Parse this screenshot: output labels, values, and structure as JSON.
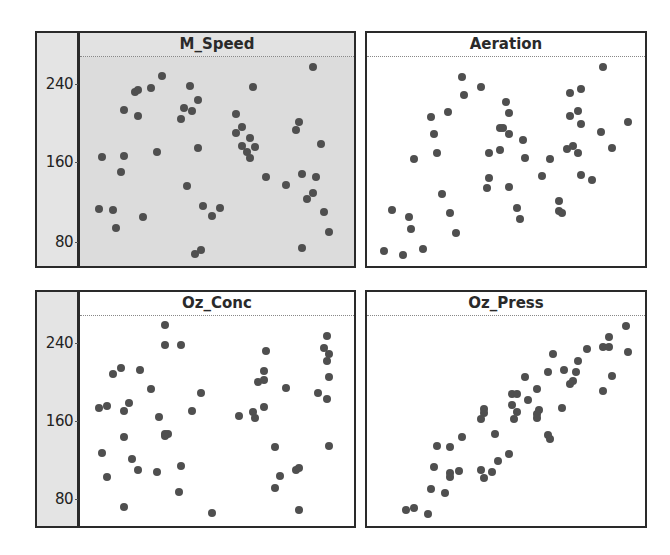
{
  "chart_data": {
    "type": "scatter",
    "title": "",
    "layout": "2x2 scatter plot matrix, shared y-axis on left",
    "y_ticks": [
      80,
      160,
      240
    ],
    "ylim": [
      51,
      274
    ],
    "x_ticks": [],
    "x_note": "x values are normalized positions (0-1) across each panel; no x-axis labels are shown",
    "grid": false,
    "legend": null,
    "panels": [
      {
        "name": "M_Speed",
        "selected": true,
        "points": [
          [
            0.3,
            246
          ],
          [
            0.26,
            234
          ],
          [
            0.2,
            230
          ],
          [
            0.21,
            232
          ],
          [
            0.4,
            236
          ],
          [
            0.43,
            222
          ],
          [
            0.38,
            213
          ],
          [
            0.41,
            210
          ],
          [
            0.16,
            211
          ],
          [
            0.21,
            205
          ],
          [
            0.37,
            202
          ],
          [
            0.08,
            163
          ],
          [
            0.16,
            164
          ],
          [
            0.28,
            168
          ],
          [
            0.43,
            172
          ],
          [
            0.15,
            148
          ],
          [
            0.39,
            133
          ],
          [
            0.07,
            110
          ],
          [
            0.12,
            109
          ],
          [
            0.23,
            102
          ],
          [
            0.13,
            90
          ],
          [
            0.45,
            113
          ],
          [
            0.48,
            103
          ],
          [
            0.42,
            64
          ],
          [
            0.44,
            68
          ],
          [
            0.85,
            255
          ],
          [
            0.63,
            235
          ],
          [
            0.57,
            207
          ],
          [
            0.59,
            194
          ],
          [
            0.57,
            188
          ],
          [
            0.8,
            199
          ],
          [
            0.79,
            191
          ],
          [
            0.62,
            183
          ],
          [
            0.59,
            174
          ],
          [
            0.64,
            173
          ],
          [
            0.61,
            168
          ],
          [
            0.62,
            162
          ],
          [
            0.88,
            176
          ],
          [
            0.68,
            143
          ],
          [
            0.81,
            146
          ],
          [
            0.86,
            143
          ],
          [
            0.75,
            134
          ],
          [
            0.85,
            126
          ],
          [
            0.83,
            120
          ],
          [
            0.51,
            111
          ],
          [
            0.89,
            107
          ],
          [
            0.91,
            86
          ],
          [
            0.81,
            70
          ]
        ]
      },
      {
        "name": "Aeration",
        "selected": false,
        "points": [
          [
            0.34,
            245
          ],
          [
            0.41,
            235
          ],
          [
            0.35,
            227
          ],
          [
            0.29,
            209
          ],
          [
            0.23,
            204
          ],
          [
            0.24,
            187
          ],
          [
            0.25,
            167
          ],
          [
            0.17,
            161
          ],
          [
            0.44,
            167
          ],
          [
            0.48,
            170
          ],
          [
            0.48,
            193
          ],
          [
            0.44,
            142
          ],
          [
            0.43,
            131
          ],
          [
            0.27,
            125
          ],
          [
            0.09,
            109
          ],
          [
            0.15,
            102
          ],
          [
            0.3,
            106
          ],
          [
            0.16,
            89
          ],
          [
            0.32,
            85
          ],
          [
            0.06,
            67
          ],
          [
            0.13,
            63
          ],
          [
            0.2,
            69
          ],
          [
            0.85,
            255
          ],
          [
            0.73,
            229
          ],
          [
            0.77,
            233
          ],
          [
            0.5,
            219
          ],
          [
            0.51,
            208
          ],
          [
            0.76,
            210
          ],
          [
            0.73,
            205
          ],
          [
            0.77,
            197
          ],
          [
            0.94,
            199
          ],
          [
            0.84,
            189
          ],
          [
            0.49,
            193
          ],
          [
            0.51,
            187
          ],
          [
            0.56,
            181
          ],
          [
            0.88,
            172
          ],
          [
            0.72,
            171
          ],
          [
            0.74,
            174
          ],
          [
            0.76,
            167
          ],
          [
            0.57,
            162
          ],
          [
            0.66,
            161
          ],
          [
            0.63,
            144
          ],
          [
            0.77,
            145
          ],
          [
            0.81,
            140
          ],
          [
            0.51,
            132
          ],
          [
            0.69,
            118
          ],
          [
            0.54,
            111
          ],
          [
            0.69,
            108
          ],
          [
            0.7,
            106
          ],
          [
            0.55,
            100
          ]
        ]
      },
      {
        "name": "Oz_Conc",
        "selected": false,
        "points": [
          [
            0.31,
            256
          ],
          [
            0.31,
            236
          ],
          [
            0.37,
            236
          ],
          [
            0.15,
            212
          ],
          [
            0.12,
            206
          ],
          [
            0.22,
            210
          ],
          [
            0.26,
            191
          ],
          [
            0.44,
            187
          ],
          [
            0.07,
            171
          ],
          [
            0.1,
            173
          ],
          [
            0.18,
            176
          ],
          [
            0.16,
            168
          ],
          [
            0.41,
            168
          ],
          [
            0.29,
            162
          ],
          [
            0.31,
            145
          ],
          [
            0.32,
            145
          ],
          [
            0.31,
            143
          ],
          [
            0.16,
            142
          ],
          [
            0.08,
            125
          ],
          [
            0.19,
            119
          ],
          [
            0.21,
            108
          ],
          [
            0.28,
            106
          ],
          [
            0.37,
            112
          ],
          [
            0.1,
            101
          ],
          [
            0.36,
            85
          ],
          [
            0.16,
            70
          ],
          [
            0.48,
            64
          ],
          [
            0.9,
            245
          ],
          [
            0.89,
            233
          ],
          [
            0.91,
            227
          ],
          [
            0.9,
            219
          ],
          [
            0.68,
            230
          ],
          [
            0.67,
            209
          ],
          [
            0.65,
            198
          ],
          [
            0.67,
            200
          ],
          [
            0.91,
            203
          ],
          [
            0.75,
            192
          ],
          [
            0.87,
            187
          ],
          [
            0.9,
            181
          ],
          [
            0.67,
            172
          ],
          [
            0.63,
            167
          ],
          [
            0.64,
            161
          ],
          [
            0.58,
            163
          ],
          [
            0.71,
            131
          ],
          [
            0.91,
            132
          ],
          [
            0.79,
            108
          ],
          [
            0.8,
            110
          ],
          [
            0.73,
            102
          ],
          [
            0.71,
            89
          ],
          [
            0.8,
            67
          ]
        ]
      },
      {
        "name": "Oz_Press",
        "selected": false,
        "points": [
          [
            0.42,
            170
          ],
          [
            0.42,
            166
          ],
          [
            0.41,
            160
          ],
          [
            0.46,
            145
          ],
          [
            0.34,
            142
          ],
          [
            0.25,
            132
          ],
          [
            0.3,
            131
          ],
          [
            0.24,
            111
          ],
          [
            0.3,
            105
          ],
          [
            0.3,
            101
          ],
          [
            0.33,
            107
          ],
          [
            0.41,
            108
          ],
          [
            0.45,
            106
          ],
          [
            0.42,
            100
          ],
          [
            0.47,
            117
          ],
          [
            0.23,
            88
          ],
          [
            0.28,
            84
          ],
          [
            0.14,
            67
          ],
          [
            0.17,
            69
          ],
          [
            0.22,
            63
          ],
          [
            0.93,
            255
          ],
          [
            0.87,
            244
          ],
          [
            0.85,
            234
          ],
          [
            0.87,
            234
          ],
          [
            0.94,
            229
          ],
          [
            0.79,
            232
          ],
          [
            0.67,
            227
          ],
          [
            0.76,
            219
          ],
          [
            0.71,
            210
          ],
          [
            0.75,
            208
          ],
          [
            0.65,
            208
          ],
          [
            0.57,
            203
          ],
          [
            0.88,
            204
          ],
          [
            0.74,
            199
          ],
          [
            0.73,
            196
          ],
          [
            0.85,
            189
          ],
          [
            0.61,
            191
          ],
          [
            0.52,
            186
          ],
          [
            0.54,
            186
          ],
          [
            0.58,
            179
          ],
          [
            0.52,
            174
          ],
          [
            0.62,
            169
          ],
          [
            0.61,
            165
          ],
          [
            0.61,
            161
          ],
          [
            0.7,
            171
          ],
          [
            0.54,
            167
          ],
          [
            0.53,
            160
          ],
          [
            0.65,
            144
          ],
          [
            0.66,
            140
          ],
          [
            0.51,
            124
          ]
        ]
      }
    ]
  },
  "labels": {
    "panel_titles": [
      "M_Speed",
      "Aeration",
      "Oz_Conc",
      "Oz_Press"
    ],
    "y_tick_labels": [
      "240",
      "160",
      "80"
    ]
  },
  "colors": {
    "dot": "#4f4f4f",
    "frame": "#2a2a2a",
    "selected_panel_bg": "#dcdcdc",
    "axis_strip_bg": "#e4e4e4"
  }
}
